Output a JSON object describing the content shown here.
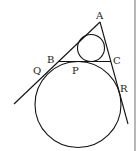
{
  "diagram": {
    "type": "geometry",
    "labels": {
      "A": "A",
      "B": "B",
      "C": "C",
      "P": "P",
      "Q": "Q",
      "R": "R"
    },
    "colors": {
      "stroke": "#111111",
      "border": "#b8b8b8",
      "background": "#ffffff"
    }
  }
}
